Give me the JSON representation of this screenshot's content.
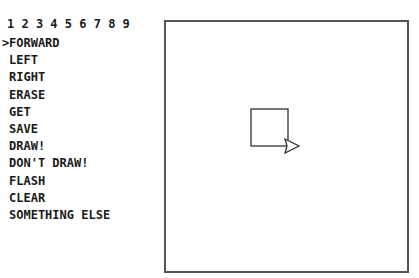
{
  "header": {
    "numbers": "1 2 3 4 5 6 7 8 9"
  },
  "menu": {
    "cursor": ">",
    "selected_index": 0,
    "items": [
      {
        "label": "FORWARD"
      },
      {
        "label": "LEFT"
      },
      {
        "label": "RIGHT"
      },
      {
        "label": "ERASE"
      },
      {
        "label": "GET"
      },
      {
        "label": "SAVE"
      },
      {
        "label": "DRAW!"
      },
      {
        "label": "DON'T DRAW!"
      },
      {
        "label": "FLASH"
      },
      {
        "label": "CLEAR"
      },
      {
        "label": "SOMETHING ELSE"
      }
    ]
  },
  "canvas": {
    "line_color": "#333333",
    "drawn_square": {
      "x": 85,
      "y": 87,
      "size": 37
    },
    "turtle": {
      "heading": "right",
      "x": 119,
      "y": 118
    }
  }
}
